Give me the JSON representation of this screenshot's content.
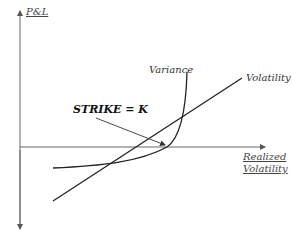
{
  "diagram": {
    "y_axis_label": "P&L",
    "x_axis_label_line1": "Realized",
    "x_axis_label_line2": "Volatility",
    "strike_label": "STRIKE = K",
    "curves": [
      {
        "name": "Variance",
        "label": "Variance",
        "shape": "convex"
      },
      {
        "name": "Volatility",
        "label": "Volatility",
        "shape": "linear"
      }
    ],
    "colors": {
      "axis": "#555555",
      "curve": "#222222",
      "text": "#333333"
    }
  }
}
